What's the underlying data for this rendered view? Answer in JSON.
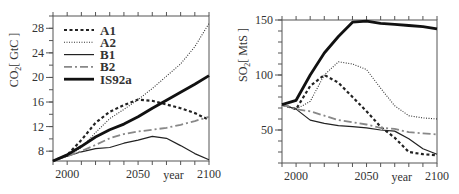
{
  "chart_data": [
    {
      "type": "line",
      "ylabel": "CO2[ GtC ]",
      "xlabel": "year",
      "x_ticks": [
        "2000",
        "2050",
        "2100"
      ],
      "y_ticks": [
        "8",
        "12",
        "16",
        "20",
        "24",
        "28"
      ],
      "xlim": [
        1990,
        2100
      ],
      "ylim": [
        6.4,
        30
      ],
      "legend_position": "upper left",
      "x": [
        1990,
        2000,
        2010,
        2020,
        2030,
        2040,
        2050,
        2060,
        2070,
        2080,
        2090,
        2100
      ],
      "series": [
        {
          "name": "A1",
          "style": "dashed",
          "values": [
            6.4,
            7.4,
            9.8,
            12.6,
            14.4,
            15.5,
            16.4,
            16.2,
            15.6,
            15.0,
            14.2,
            13.1
          ]
        },
        {
          "name": "A2",
          "style": "dotted",
          "values": [
            6.4,
            7.2,
            8.6,
            11.0,
            13.3,
            14.8,
            16.4,
            18.2,
            20.2,
            22.2,
            25.0,
            28.8
          ]
        },
        {
          "name": "B1",
          "style": "solid-thin",
          "values": [
            6.4,
            7.2,
            7.9,
            8.4,
            8.6,
            9.3,
            9.8,
            10.4,
            10.1,
            8.9,
            7.6,
            6.6
          ]
        },
        {
          "name": "B2",
          "style": "dash-dot",
          "values": [
            6.4,
            7.2,
            8.0,
            9.0,
            10.1,
            10.8,
            11.2,
            11.5,
            11.8,
            12.3,
            12.9,
            13.6
          ]
        },
        {
          "name": "IS92a",
          "style": "solid-thick",
          "values": [
            6.4,
            7.4,
            8.8,
            10.3,
            11.5,
            12.4,
            13.6,
            15.0,
            16.3,
            17.6,
            18.9,
            20.3
          ]
        }
      ]
    },
    {
      "type": "line",
      "ylabel": "SO2[ MtS ]",
      "xlabel": "year",
      "x_ticks": [
        "2000",
        "2050",
        "2100"
      ],
      "y_ticks": [
        "50",
        "100",
        "150"
      ],
      "xlim": [
        1990,
        2100
      ],
      "ylim": [
        20,
        150
      ],
      "x": [
        1990,
        2000,
        2010,
        2020,
        2030,
        2040,
        2050,
        2060,
        2070,
        2080,
        2090,
        2100
      ],
      "series": [
        {
          "name": "A1",
          "style": "dashed",
          "values": [
            73,
            69,
            90,
            100,
            93,
            80,
            67,
            53,
            43,
            30,
            28,
            27
          ]
        },
        {
          "name": "A2",
          "style": "dotted",
          "values": [
            73,
            69,
            76,
            100,
            112,
            110,
            105,
            88,
            72,
            63,
            61,
            60
          ]
        },
        {
          "name": "B1",
          "style": "solid-thin",
          "values": [
            73,
            69,
            59,
            56,
            54,
            53,
            52,
            50,
            49,
            42,
            33,
            28
          ]
        },
        {
          "name": "B2",
          "style": "dash-dot",
          "values": [
            73,
            69,
            67,
            63,
            59,
            57,
            55,
            52,
            51,
            48,
            47,
            46
          ]
        },
        {
          "name": "IS92a",
          "style": "solid-thick",
          "values": [
            73,
            77,
            100,
            120,
            135,
            148,
            149,
            147,
            146,
            145,
            144,
            142
          ]
        }
      ]
    }
  ],
  "left": {
    "ylabel_main": "CO",
    "ylabel_sub": "2",
    "ylabel_unit": "[ GtC ]",
    "legend": [
      "A1",
      "A2",
      "B1",
      "B2",
      "IS92a"
    ]
  },
  "right": {
    "ylabel_main": "SO",
    "ylabel_sub": "2",
    "ylabel_unit": "[ MtS ]"
  }
}
